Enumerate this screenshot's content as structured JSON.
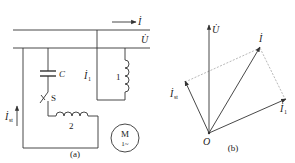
{
  "figure_a": {
    "caption": "(a)",
    "current_label": "İ",
    "voltage_label": "U̇",
    "branch1_current_label": "İ",
    "branch1_current_sub": "1",
    "start_current_label": "İ",
    "start_current_sub": "st",
    "capacitor_label": "C",
    "switch_label": "S",
    "winding1_label": "1",
    "winding2_label": "2",
    "motor_label": "M",
    "motor_phase_label": "1~"
  },
  "figure_b": {
    "caption": "(b)",
    "origin_label": "O",
    "vectors": [
      {
        "name": "U",
        "label": "U̇",
        "sub": ""
      },
      {
        "name": "I",
        "label": "İ",
        "sub": ""
      },
      {
        "name": "Ist",
        "label": "İ",
        "sub": "st"
      },
      {
        "name": "I1",
        "label": "İ",
        "sub": "1"
      }
    ]
  },
  "colors": {
    "line": "#333333",
    "dashed": "#888888",
    "background": "#ffffff"
  }
}
